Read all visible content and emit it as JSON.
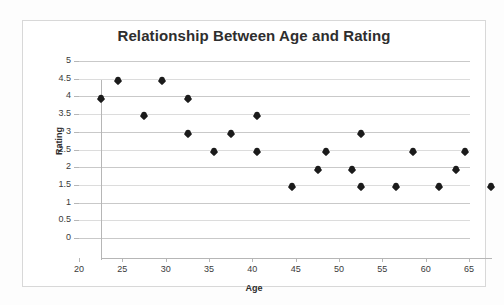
{
  "chart_data": {
    "type": "scatter",
    "title": "Relationship Between Age and Rating",
    "xlabel": "Age",
    "ylabel": "Rating",
    "xlim": [
      20,
      65
    ],
    "ylim": [
      0,
      5
    ],
    "grid": true,
    "legend": null,
    "x_ticks": [
      20,
      25,
      30,
      35,
      40,
      45,
      50,
      55,
      60,
      65
    ],
    "y_ticks": [
      0,
      0.5,
      1,
      1.5,
      2,
      2.5,
      3,
      3.5,
      4,
      4.5,
      5
    ],
    "x_tick_labels": [
      "20",
      "25",
      "30",
      "35",
      "40",
      "45",
      "50",
      "55",
      "60",
      "65"
    ],
    "y_tick_labels": [
      "0",
      "0.5",
      "1",
      "1.5",
      "2",
      "2.5",
      "3",
      "3.5",
      "4",
      "4.5",
      "5"
    ],
    "marker": "diamond",
    "marker_color": "#1b1b1b",
    "points": [
      {
        "x": 20,
        "y": 4.5
      },
      {
        "x": 22,
        "y": 5
      },
      {
        "x": 25,
        "y": 4
      },
      {
        "x": 27,
        "y": 5
      },
      {
        "x": 30,
        "y": 4.5
      },
      {
        "x": 30,
        "y": 3.5
      },
      {
        "x": 33,
        "y": 3
      },
      {
        "x": 35,
        "y": 3.5
      },
      {
        "x": 38,
        "y": 4
      },
      {
        "x": 38,
        "y": 3
      },
      {
        "x": 42,
        "y": 2
      },
      {
        "x": 45,
        "y": 2.5
      },
      {
        "x": 46,
        "y": 3
      },
      {
        "x": 49,
        "y": 2.5
      },
      {
        "x": 50,
        "y": 3.5
      },
      {
        "x": 50,
        "y": 2
      },
      {
        "x": 54,
        "y": 2
      },
      {
        "x": 56,
        "y": 3
      },
      {
        "x": 59,
        "y": 2
      },
      {
        "x": 61,
        "y": 2.5
      },
      {
        "x": 62,
        "y": 3
      },
      {
        "x": 65,
        "y": 2
      }
    ]
  },
  "style": {
    "background": "#ffffff",
    "frame_border": "#d8d8d8",
    "gridline_color": "#c9c9c9",
    "axis_color": "#b6b6b6",
    "title_color": "#2e2e2e",
    "tick_label_color": "#3a3a3a"
  }
}
